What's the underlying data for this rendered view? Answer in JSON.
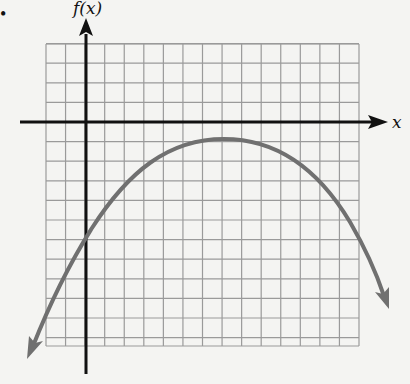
{
  "chart_data": {
    "type": "line",
    "title": "",
    "xlabel": "x",
    "ylabel": "f(x)",
    "grid": true,
    "xlim": [
      -2,
      14
    ],
    "ylim": [
      -11.5,
      4
    ],
    "function": "parabola opening downward",
    "vertex": [
      7,
      -1
    ],
    "y_intercept": [
      0,
      -6
    ],
    "points": [
      {
        "x": -3,
        "y": -12
      },
      {
        "x": 0,
        "y": -6
      },
      {
        "x": 3,
        "y": -2.6
      },
      {
        "x": 7,
        "y": -1
      },
      {
        "x": 11,
        "y": -2.6
      },
      {
        "x": 14,
        "y": -6
      },
      {
        "x": 15.5,
        "y": -9.4
      }
    ],
    "curve_color": "#6e6e6e",
    "arrows_on_both_ends": true
  },
  "labels": {
    "y_axis": "f(x)",
    "x_axis": "x",
    "bullet": "•"
  }
}
